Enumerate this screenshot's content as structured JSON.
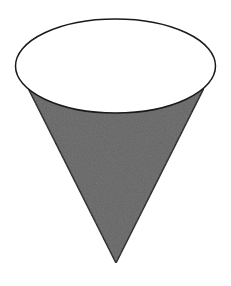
{
  "figure": {
    "shape": "inverted-cone",
    "colors": {
      "background": "#ffffff",
      "cone_fill": "#666666",
      "top_ellipse_fill": "#ffffff",
      "stroke": "#1a1a1a"
    },
    "geometry": {
      "ellipse": {
        "cx": 115.5,
        "cy": 66,
        "rx": 100,
        "ry": 47
      },
      "apex": {
        "x": 116,
        "y": 263
      },
      "left_tangent": {
        "x": 28,
        "y": 88
      },
      "right_tangent": {
        "x": 204,
        "y": 88
      }
    }
  }
}
